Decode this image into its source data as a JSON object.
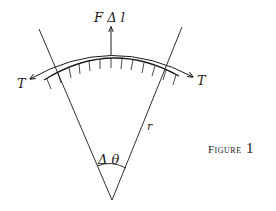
{
  "figure": {
    "caption_word": "Figure",
    "caption_number": "1"
  },
  "labels": {
    "force": "F Δ l",
    "tension_left": "T",
    "tension_right": "T",
    "radius": "r",
    "angle": "Δ θ"
  },
  "colors": {
    "ink": "#1a1a1a",
    "background": "#ffffff"
  }
}
